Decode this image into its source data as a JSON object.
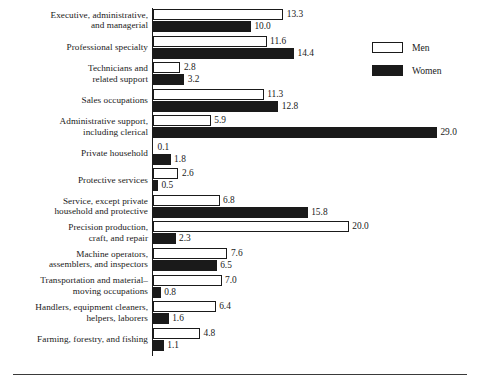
{
  "chart_data": {
    "type": "bar",
    "orientation": "horizontal",
    "title": "",
    "subtitle": "",
    "xlabel": "",
    "ylabel": "",
    "xlim": [
      0,
      30
    ],
    "grid": false,
    "legend_position": "top-right",
    "value_label_format": "one-decimal",
    "categories": [
      "Executive, administrative,\nand managerial",
      "Professional specialty",
      "Technicians and\nrelated support",
      "Sales occupations",
      "Administrative support,\nincluding clerical",
      "Private household",
      "Protective services",
      "Service, except private\nhousehold and protective",
      "Precision production,\ncraft, and repair",
      "Machine operators,\nassemblers, and inspectors",
      "Transportation and material–\nmoving occupations",
      "Handlers, equipment cleaners,\nhelpers, laborers",
      "Farming, forestry, and fishing"
    ],
    "series": [
      {
        "name": "Men",
        "color": "#ffffff",
        "edge_color": "#1a1a1a",
        "values": [
          13.3,
          11.6,
          2.8,
          11.3,
          5.9,
          0.1,
          2.6,
          6.8,
          20.0,
          7.6,
          7.0,
          6.4,
          4.8
        ]
      },
      {
        "name": "Women",
        "color": "#1a1a1a",
        "edge_color": "#1a1a1a",
        "values": [
          10.0,
          14.4,
          3.2,
          12.8,
          29.0,
          1.8,
          0.5,
          15.8,
          2.3,
          6.5,
          0.8,
          1.6,
          1.1
        ]
      }
    ]
  },
  "legend": {
    "items": [
      {
        "label": "Men"
      },
      {
        "label": "Women"
      }
    ]
  },
  "colors": {
    "men_fill": "#ffffff",
    "women_fill": "#1a1a1a",
    "axis": "#1a1a1a",
    "rule": "#3a3a3a",
    "background": "#ffffff"
  }
}
